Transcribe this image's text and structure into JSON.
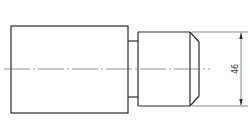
{
  "drawing": {
    "type": "technical-drawing",
    "view": "side elevation of stepped shaft",
    "dimensions": [
      {
        "label": "46",
        "orientation": "vertical",
        "applies_to": "small-diameter-section"
      }
    ],
    "colors": {
      "line": "#2a2a2a",
      "background": "#ffffff"
    }
  }
}
